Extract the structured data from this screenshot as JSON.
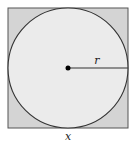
{
  "diagram": {
    "type": "circle-inscribed-in-square",
    "square": {
      "x": 8,
      "y": 8,
      "size": 120,
      "fill": "#d4d4d4",
      "stroke": "#555555",
      "label": "x"
    },
    "circle": {
      "cx": 68,
      "cy": 68,
      "r": 60,
      "fill": "#ebebeb",
      "stroke": "#333333"
    },
    "center_point": {
      "cx": 68,
      "cy": 68,
      "r": 2.5,
      "fill": "#000000"
    },
    "radius_line": {
      "x1": 68,
      "y1": 68,
      "x2": 128,
      "y2": 68,
      "stroke": "#333333",
      "label": "r"
    }
  }
}
